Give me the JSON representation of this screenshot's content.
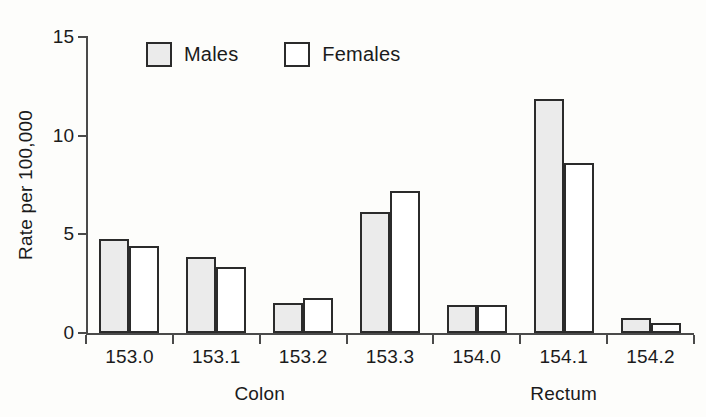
{
  "chart_data": {
    "type": "bar",
    "title": "",
    "subtitle": "",
    "xlabel": "",
    "ylabel": "Rate per 100,000",
    "ylim": [
      0,
      15
    ],
    "yticks": [
      0,
      5,
      10,
      15
    ],
    "ytick_labels": [
      "0",
      "5",
      "10",
      "15"
    ],
    "grid": false,
    "legend_position": "top-center",
    "categories": [
      "153.0",
      "153.1",
      "153.2",
      "153.3",
      "154.0",
      "154.1",
      "154.2"
    ],
    "series": [
      {
        "name": "Males",
        "values": [
          4.75,
          3.85,
          1.5,
          6.15,
          1.4,
          11.85,
          0.75
        ]
      },
      {
        "name": "Females",
        "values": [
          4.4,
          3.35,
          1.75,
          7.2,
          1.4,
          8.6,
          0.5
        ]
      }
    ],
    "group_annotations": [
      {
        "label": "Colon",
        "categories": [
          "153.0",
          "153.1",
          "153.2",
          "153.3"
        ]
      },
      {
        "label": "Rectum",
        "categories": [
          "154.0",
          "154.1",
          "154.2"
        ]
      }
    ]
  },
  "legend": {
    "items": [
      {
        "label": "Males",
        "swatch": "filled-gray-square-icon"
      },
      {
        "label": "Females",
        "swatch": "empty-white-square-icon"
      }
    ]
  },
  "colors": {
    "male_fill": "#ebebeb",
    "female_fill": "#ffffff",
    "bar_outline": "#2b2b2b",
    "axis": "#4a4a4a",
    "text": "#1b1b1b",
    "background": "#fdfdfb"
  }
}
